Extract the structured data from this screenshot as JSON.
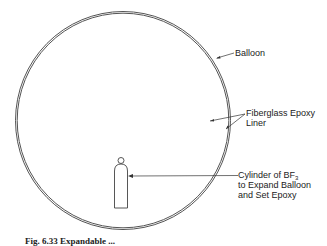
{
  "diagram": {
    "labels": {
      "balloon": "Balloon",
      "liner_line1": "Fiberglass Epoxy",
      "liner_line2": "Liner",
      "cylinder_line1_prefix": "Cylinder of BF",
      "cylinder_line1_sub": "3",
      "cylinder_line2": "to Expand Balloon",
      "cylinder_line3": "and Set Epoxy"
    },
    "caption": "Fig. 6.33  Expandable ..."
  },
  "colors": {
    "stroke": "#555555",
    "text": "#222222",
    "background": "#ffffff"
  }
}
